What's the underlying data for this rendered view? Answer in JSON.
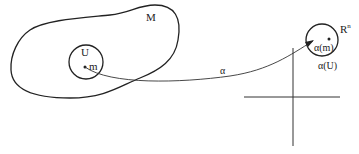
{
  "diagram": {
    "labels": {
      "manifold": "M",
      "open_set": "U",
      "point": "m",
      "map": "α",
      "target_space_base": "R",
      "target_space_exp": "n",
      "image_point": "α(m)",
      "image_set": "α(U)"
    },
    "colors": {
      "stroke": "#222222",
      "background": "#ffffff"
    },
    "shapes": {
      "manifold_region": "closed irregular blob",
      "open_set_circle": {
        "cx": 86,
        "cy": 62,
        "r": 17
      },
      "image_circle": {
        "cx": 322,
        "cy": 40,
        "r": 16
      },
      "axes": {
        "origin_x": 293,
        "origin_y": 97
      }
    }
  }
}
